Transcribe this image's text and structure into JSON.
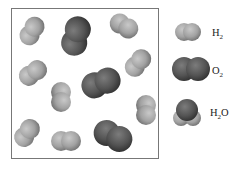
{
  "figure": {
    "container_contents": {
      "H2_count": 8,
      "O2_count": 3,
      "H2O_count": 0
    }
  },
  "colors": {
    "hydrogen": "#9a9a9a",
    "hydrogen_highlight": "#c8c8c8",
    "oxygen": "#4e4e4e",
    "oxygen_highlight": "#7a7a7a",
    "border": "#777777"
  },
  "legend": [
    {
      "id": "h2",
      "base": "H",
      "sub": "2",
      "tail": "",
      "label": "H2"
    },
    {
      "id": "o2",
      "base": "O",
      "sub": "2",
      "tail": "",
      "label": "O2"
    },
    {
      "id": "h2o",
      "base": "H",
      "sub": "2",
      "tail": "O",
      "label": "H2O"
    }
  ]
}
